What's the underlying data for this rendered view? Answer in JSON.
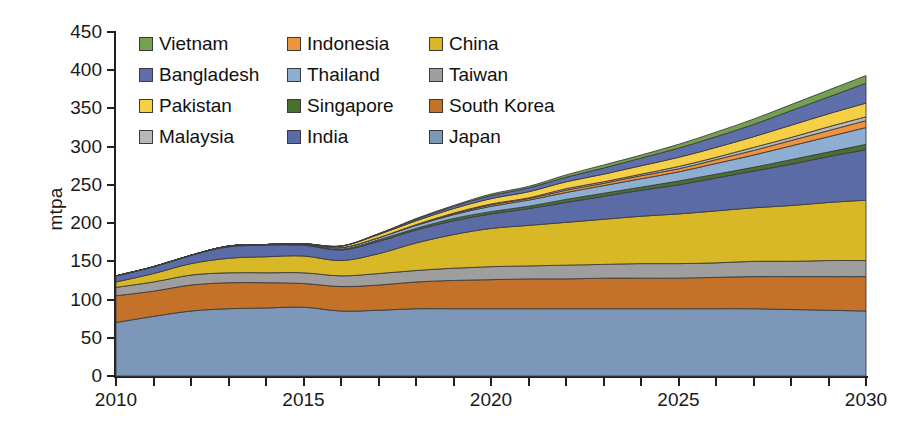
{
  "chart_data": {
    "type": "area",
    "stacked": true,
    "title": "",
    "xlabel": "",
    "ylabel": "mtpa",
    "xlim": [
      2010,
      2030
    ],
    "ylim": [
      0,
      450
    ],
    "ytick_labels": [
      "0",
      "50",
      "100",
      "150",
      "200",
      "250",
      "300",
      "350",
      "400",
      "450"
    ],
    "ytick_values": [
      0,
      50,
      100,
      150,
      200,
      250,
      300,
      350,
      400,
      450
    ],
    "xtick_labels": [
      "2010",
      "2015",
      "2020",
      "2025",
      "2030"
    ],
    "xtick_values": [
      2010,
      2015,
      2020,
      2025,
      2030
    ],
    "xtick_minor_step": 1,
    "grid": false,
    "legend_position": "top-inside",
    "x": [
      2010,
      2011,
      2012,
      2013,
      2014,
      2015,
      2016,
      2017,
      2018,
      2019,
      2020,
      2021,
      2022,
      2023,
      2024,
      2025,
      2026,
      2027,
      2028,
      2029,
      2030
    ],
    "series": [
      {
        "name": "Japan",
        "color": "#7d97b8",
        "values": [
          70,
          78,
          85,
          88,
          89,
          90,
          85,
          86,
          88,
          88,
          88,
          88,
          88,
          88,
          88,
          88,
          88,
          88,
          87,
          86,
          85
        ]
      },
      {
        "name": "South Korea",
        "color": "#c4712a",
        "values": [
          35,
          33,
          34,
          34,
          33,
          31,
          32,
          33,
          35,
          37,
          38,
          39,
          39,
          40,
          40,
          40,
          41,
          42,
          43,
          44,
          45
        ]
      },
      {
        "name": "Taiwan",
        "color": "#9e9e9e",
        "values": [
          11,
          12,
          13,
          13,
          13,
          14,
          14,
          15,
          15,
          16,
          17,
          17,
          18,
          18,
          19,
          19,
          19,
          20,
          20,
          21,
          21
        ]
      },
      {
        "name": "China",
        "color": "#d8b827",
        "values": [
          7,
          11,
          15,
          19,
          21,
          22,
          20,
          26,
          36,
          44,
          50,
          53,
          56,
          59,
          62,
          65,
          68,
          70,
          73,
          76,
          79
        ]
      },
      {
        "name": "India",
        "color": "#5b6ba5",
        "values": [
          8,
          9,
          11,
          15,
          15,
          14,
          14,
          16,
          17,
          18,
          19,
          22,
          26,
          30,
          34,
          38,
          43,
          48,
          54,
          60,
          66
        ]
      },
      {
        "name": "Singapore",
        "color": "#4a7030",
        "values": [
          0,
          0,
          0,
          1,
          1,
          1,
          1,
          2,
          2,
          3,
          3,
          3,
          4,
          4,
          4,
          5,
          5,
          5,
          6,
          6,
          7
        ]
      },
      {
        "name": "Thailand",
        "color": "#8eafd2",
        "values": [
          0,
          0,
          0,
          0,
          0,
          1,
          2,
          3,
          4,
          5,
          7,
          8,
          9,
          10,
          11,
          12,
          14,
          16,
          18,
          20,
          22
        ]
      },
      {
        "name": "Indonesia",
        "color": "#f0933f",
        "values": [
          0,
          0,
          0,
          0,
          0,
          0,
          0,
          0,
          1,
          1,
          2,
          2,
          3,
          3,
          4,
          4,
          5,
          6,
          7,
          8,
          9
        ]
      },
      {
        "name": "Malaysia",
        "color": "#b8b8b8",
        "values": [
          0,
          0,
          0,
          0,
          0,
          0,
          0,
          0,
          0,
          1,
          1,
          1,
          2,
          2,
          2,
          3,
          3,
          4,
          4,
          5,
          5
        ]
      },
      {
        "name": "Pakistan",
        "color": "#f5cf45",
        "values": [
          0,
          0,
          0,
          0,
          0,
          0,
          2,
          4,
          5,
          6,
          7,
          8,
          9,
          10,
          11,
          12,
          13,
          14,
          16,
          17,
          18
        ]
      },
      {
        "name": "Bangladesh",
        "color": "#5e6fab",
        "values": [
          0,
          0,
          0,
          0,
          0,
          0,
          0,
          1,
          2,
          3,
          4,
          5,
          6,
          8,
          10,
          12,
          14,
          16,
          19,
          22,
          26
        ]
      },
      {
        "name": "Vietnam",
        "color": "#74a050",
        "values": [
          0,
          0,
          0,
          0,
          0,
          0,
          0,
          0,
          1,
          1,
          2,
          2,
          3,
          4,
          4,
          5,
          6,
          7,
          8,
          9,
          10
        ]
      }
    ],
    "totals": [
      131,
      143,
      158,
      170,
      172,
      173,
      170,
      186,
      206,
      223,
      238,
      248,
      263,
      276,
      289,
      303,
      319,
      336,
      355,
      374,
      393
    ]
  },
  "legend": {
    "rows": [
      [
        {
          "label": "Vietnam",
          "color": "#74a050"
        },
        {
          "label": "Indonesia",
          "color": "#f0933f"
        },
        {
          "label": "China",
          "color": "#d8b827"
        }
      ],
      [
        {
          "label": "Bangladesh",
          "color": "#5e6fab"
        },
        {
          "label": "Thailand",
          "color": "#8eafd2"
        },
        {
          "label": "Taiwan",
          "color": "#9e9e9e"
        }
      ],
      [
        {
          "label": "Pakistan",
          "color": "#f5cf45"
        },
        {
          "label": "Singapore",
          "color": "#4a7030"
        },
        {
          "label": "South Korea",
          "color": "#c4712a"
        }
      ],
      [
        {
          "label": "Malaysia",
          "color": "#b8b8b8"
        },
        {
          "label": "India",
          "color": "#5b6ba5"
        },
        {
          "label": "Japan",
          "color": "#7d97b8"
        }
      ]
    ]
  },
  "axes": {
    "y_title": "mtpa",
    "y_ticks": [
      "450",
      "400",
      "350",
      "300",
      "250",
      "200",
      "150",
      "100",
      "50",
      "0"
    ],
    "x_ticks": [
      "2010",
      "2015",
      "2020",
      "2025",
      "2030"
    ]
  }
}
